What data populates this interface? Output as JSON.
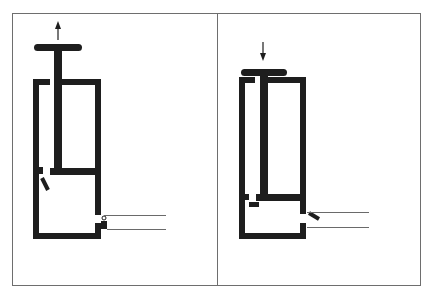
{
  "figure": {
    "colors": {
      "ink": "#1e1e1e",
      "frame": "#6e6e6e",
      "pipe": "#6a6a6a",
      "background": "#ffffff"
    },
    "panels": [
      {
        "id": "left",
        "state": "piston pulled up (intake stroke)",
        "arrow": "up",
        "inlet_valve": "open",
        "outlet_valve": "closed"
      },
      {
        "id": "right",
        "state": "piston pushed down (discharge stroke)",
        "arrow": "down",
        "inlet_valve": "closed",
        "outlet_valve": "open"
      }
    ]
  }
}
